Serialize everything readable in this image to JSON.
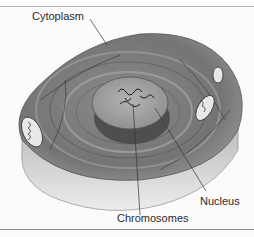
{
  "figure": {
    "labels": {
      "cytoplasm": "Cytoplasm",
      "nucleus": "Nucleus",
      "chromosomes": "Chromosomes"
    },
    "colors": {
      "background": "#fbfbfb",
      "cell_top": "#7a7a7a",
      "cell_side": "#d8d8d8",
      "nucleus": "#a8a8a8",
      "nucleus_shadow": "#4e4e4e",
      "leader_line": "#333333",
      "rule": "#8c8c8c"
    }
  }
}
